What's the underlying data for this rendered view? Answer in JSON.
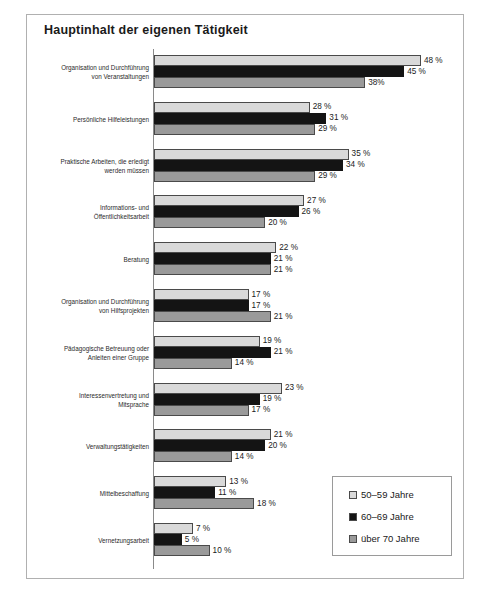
{
  "title": "Hauptinhalt der eigenen Tätigkeit",
  "legend": {
    "items": [
      {
        "label": "50–59 Jahre",
        "color": "#d9d9d9"
      },
      {
        "label": "60–69 Jahre",
        "color": "#141414"
      },
      {
        "label": "über 70 Jahre",
        "color": "#9a9a9a"
      }
    ]
  },
  "chart_data": {
    "type": "bar",
    "orientation": "horizontal",
    "title": "Hauptinhalt der eigenen Tätigkeit",
    "xlabel": "",
    "ylabel": "",
    "xlim": [
      0,
      52
    ],
    "grid": false,
    "legend_position": "bottom-right",
    "value_suffix": "%",
    "categories": [
      "Organisation und Durchführung von Veranstaltungen",
      "Persönliche Hilfeleistungen",
      "Praktische Arbeiten, die erledigt werden müssen",
      "Informations- und Öffentlichkeitsarbeit",
      "Beratung",
      "Organisation und Durchführung von Hilfsprojekten",
      "Pädagogische Betreuung oder Anleiten einer Gruppe",
      "Interessenvertretung und Mitsprache",
      "Verwaltungstätigkeiten",
      "Mittelbeschaffung",
      "Vernetzungsarbeit"
    ],
    "category_lines": [
      [
        "Organisation und Durchführung",
        "von Veranstaltungen"
      ],
      [
        "Persönliche Hilfeleistungen"
      ],
      [
        "Praktische Arbeiten, die erledigt",
        "werden müssen"
      ],
      [
        "Informations- und",
        "Öffentlichkeitsarbeit"
      ],
      [
        "Beratung"
      ],
      [
        "Organisation und Durchführung",
        "von Hilfsprojekten"
      ],
      [
        "Pädagogische Betreuung oder",
        "Anleiten einer Gruppe"
      ],
      [
        "Interessenvertretung und",
        "Mitsprache"
      ],
      [
        "Verwaltungstätigkeiten"
      ],
      [
        "Mittelbeschaffung"
      ],
      [
        "Vernetzungsarbeit"
      ]
    ],
    "series": [
      {
        "name": "50–59 Jahre",
        "color": "#d9d9d9",
        "values": [
          48,
          28,
          35,
          27,
          22,
          17,
          19,
          23,
          21,
          13,
          7
        ],
        "labels": [
          "48 %",
          "28 %",
          "35 %",
          "27 %",
          "22 %",
          "17 %",
          "19 %",
          "23 %",
          "21 %",
          "13 %",
          "7 %"
        ]
      },
      {
        "name": "60–69 Jahre",
        "color": "#141414",
        "values": [
          45,
          31,
          34,
          26,
          21,
          17,
          21,
          19,
          20,
          11,
          5
        ],
        "labels": [
          "45 %",
          "31 %",
          "34 %",
          "26 %",
          "21 %",
          "17 %",
          "21 %",
          "19 %",
          "20 %",
          "11 %",
          "5 %"
        ]
      },
      {
        "name": "über 70 Jahre",
        "color": "#9a9a9a",
        "values": [
          38,
          29,
          29,
          20,
          21,
          21,
          14,
          17,
          14,
          18,
          10
        ],
        "labels": [
          "38%",
          "29 %",
          "29 %",
          "20 %",
          "21 %",
          "21 %",
          "14 %",
          "17 %",
          "14 %",
          "18 %",
          "10 %"
        ]
      }
    ]
  }
}
